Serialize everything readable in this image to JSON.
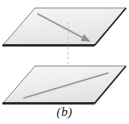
{
  "figure": {
    "caption": "(b)",
    "alt_description": "Two parallel planes, each drawn as a shaded parallelogram, with a directed line segment lying in each plane and a faint vertical dashed line joining them",
    "colors": {
      "plane_fill": "#ededed",
      "plane_fill_light": "#f5f5f5",
      "plane_outline": "#8c8c8c",
      "plane_base_edge": "#1c1c1c",
      "vector_line": "#9a9a9a",
      "dashed_connector": "#c4c4c4",
      "caption_text": "#1a1a1a",
      "background": "#ffffff"
    },
    "planes": [
      {
        "name": "upper-plane",
        "label": "",
        "points": "35,8 126,8 94,45 3,45",
        "base_edge": {
          "x1": 3,
          "y1": 45,
          "x2": 94,
          "y2": 45
        }
      },
      {
        "name": "lower-plane",
        "label": "",
        "points": "35,66 126,66 94,103 3,103",
        "base_edge": {
          "x1": 3,
          "y1": 103,
          "x2": 94,
          "y2": 103
        }
      }
    ],
    "segments": [
      {
        "name": "upper-plane-vector",
        "plane": "upper-plane",
        "x1": 38,
        "y1": 14,
        "x2": 89,
        "y2": 41,
        "arrow": "end",
        "direction": "down-right"
      },
      {
        "name": "lower-plane-vector",
        "plane": "lower-plane",
        "x1": 24,
        "y1": 98,
        "x2": 108,
        "y2": 73,
        "arrow": "none",
        "direction": "up-right"
      }
    ],
    "connector": {
      "name": "vertical-dashed-connector",
      "x1": 68,
      "y1": 22,
      "x2": 68,
      "y2": 90,
      "style": "dashed"
    }
  }
}
